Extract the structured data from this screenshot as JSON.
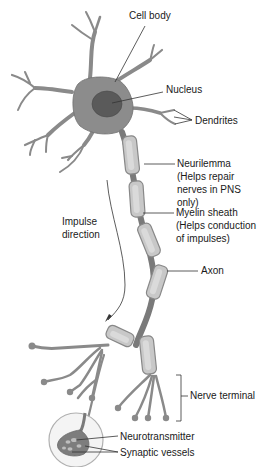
{
  "diagram": {
    "labels": {
      "cell_body": "Cell body",
      "nucleus": "Nucleus",
      "dendrites": "Dendrites",
      "neurilemma": [
        "Neurilemma",
        "(Helps repair",
        "nerves in PNS",
        "only)"
      ],
      "myelin_sheath": [
        "Myelin sheath",
        "(Helps conduction",
        "of impulses)"
      ],
      "impulse_direction": [
        "Impulse",
        "direction"
      ],
      "axon": "Axon",
      "nerve_terminal": "Nerve terminal",
      "neurotransmitter": "Neurotransmitter",
      "synaptic_vessels": "Synaptic vessels"
    },
    "colors": {
      "cell_body": "#8c8c8c",
      "nucleus": "#5a5a5a",
      "myelin": "#c8c8c8",
      "background": "#ffffff"
    }
  }
}
